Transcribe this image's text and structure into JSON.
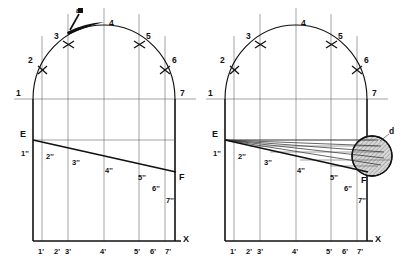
{
  "figure": {
    "background_color": "#ffffff",
    "line_color": "#111111",
    "grid_color": "#555555"
  },
  "panels": [
    {
      "id": "left",
      "name": "left-panel",
      "arc_labels": [
        "1",
        "2",
        "3",
        "4",
        "5",
        "6",
        "7"
      ],
      "marked_arc_labels": [
        "2",
        "3",
        "5",
        "6"
      ],
      "development_labels": [
        "1''",
        "2''",
        "3''",
        "4''",
        "5''",
        "6''",
        "7''"
      ],
      "baseline_labels": [
        "1'",
        "2'",
        "3'",
        "4'",
        "5'",
        "6'",
        "7'"
      ],
      "point_E": "E",
      "point_F": "F",
      "axis_label": "X",
      "annotation": "a"
    },
    {
      "id": "right",
      "name": "right-panel",
      "arc_labels": [
        "1",
        "2",
        "3",
        "4",
        "5",
        "6",
        "7"
      ],
      "marked_arc_labels": [
        "2",
        "3",
        "5",
        "6"
      ],
      "development_labels": [
        "1''",
        "2''",
        "3''",
        "4''",
        "5''",
        "6''",
        "7''"
      ],
      "baseline_labels": [
        "1'",
        "2'",
        "3'",
        "4'",
        "5'",
        "6'",
        "7'"
      ],
      "point_E": "E",
      "point_F": "F",
      "axis_label": "X",
      "annotation": "d"
    }
  ]
}
